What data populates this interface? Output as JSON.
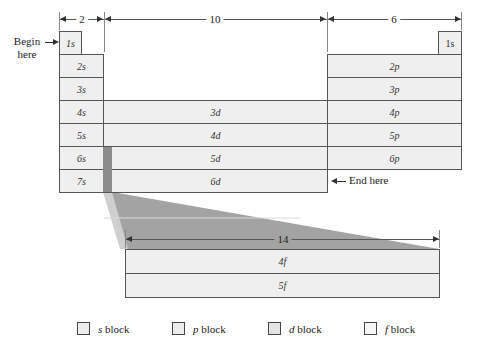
{
  "dimensions": {
    "s_width": "2",
    "d_width": "10",
    "p_width": "6",
    "f_width": "14"
  },
  "annotations": {
    "begin": "Begin\nhere",
    "begin_line1": "Begin",
    "begin_line2": "here",
    "end": "End here"
  },
  "s_block": [
    "1s",
    "2s",
    "3s",
    "4s",
    "5s",
    "6s",
    "7s"
  ],
  "p_block": {
    "he": "1s",
    "rows": [
      "2p",
      "3p",
      "4p",
      "5p",
      "6p"
    ]
  },
  "d_block": [
    "3d",
    "4d",
    "5d",
    "6d"
  ],
  "f_block": [
    "4f",
    "5f"
  ],
  "legend": [
    {
      "label": "s block",
      "italic": "s",
      "rest": " block"
    },
    {
      "label": "p block",
      "italic": "p",
      "rest": " block"
    },
    {
      "label": "d block",
      "italic": "d",
      "rest": " block"
    },
    {
      "label": "f block",
      "italic": "f",
      "rest": " block"
    }
  ],
  "colors": {
    "cell_fill": "#efefef",
    "border": "#555555",
    "wedge": "#9a9a9a",
    "strip": "#8c8c8c"
  }
}
